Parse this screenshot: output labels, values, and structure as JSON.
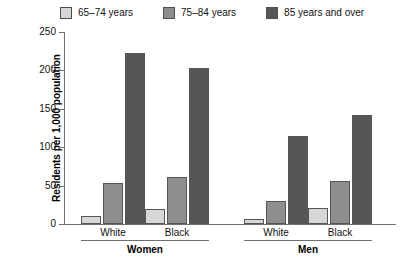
{
  "chart_data": {
    "type": "bar",
    "title": "",
    "xlabel": "",
    "ylabel": "Residents per 1,000 population",
    "ylim": [
      0,
      250
    ],
    "yticks": [
      0,
      50,
      100,
      150,
      200,
      250
    ],
    "grid": false,
    "legend_position": "top",
    "categories": [
      "White",
      "Black",
      "White",
      "Black"
    ],
    "group_labels": [
      "Women",
      "Men"
    ],
    "series": [
      {
        "name": "65–74 years",
        "color": "#d7d7d7",
        "values": [
          10,
          19,
          7,
          21
        ]
      },
      {
        "name": "75–84 years",
        "color": "#8e8e8e",
        "values": [
          53,
          61,
          30,
          56
        ]
      },
      {
        "name": "85 years and over",
        "color": "#565656",
        "values": [
          223,
          203,
          114,
          142
        ]
      }
    ]
  },
  "legend": {
    "items": [
      {
        "label": "65–74 years"
      },
      {
        "label": "75–84 years"
      },
      {
        "label": "85 years and over"
      }
    ]
  },
  "axis": {
    "y_title": "Residents per 1,000 population",
    "y_ticks": [
      "0",
      "50",
      "100",
      "150",
      "200",
      "250"
    ]
  },
  "categories": [
    {
      "label": "White"
    },
    {
      "label": "Black"
    },
    {
      "label": "White"
    },
    {
      "label": "Black"
    }
  ],
  "groups": [
    {
      "label": "Women"
    },
    {
      "label": "Men"
    }
  ]
}
